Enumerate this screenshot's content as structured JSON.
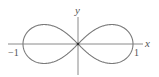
{
  "figure": {
    "title": "",
    "curve_description": "Lemniscate (figure-eight) symmetric about both axes",
    "axes": {
      "x_label": "x",
      "y_label": "y"
    },
    "ticks": {
      "left": "−1",
      "right": "1"
    },
    "colors": {
      "curve": "#7a7a7a",
      "axes": "#8a8a8a",
      "labels": "#555555"
    }
  },
  "chart_data": {
    "type": "line",
    "title": "",
    "xlabel": "x",
    "ylabel": "y",
    "xlim": [
      -1.2,
      1.2
    ],
    "curve": "lemniscate r^2 = cos(2θ)",
    "x_intercepts": [
      -1,
      0,
      1
    ],
    "tick_labels": [
      "−1",
      "1"
    ],
    "grid": false
  }
}
